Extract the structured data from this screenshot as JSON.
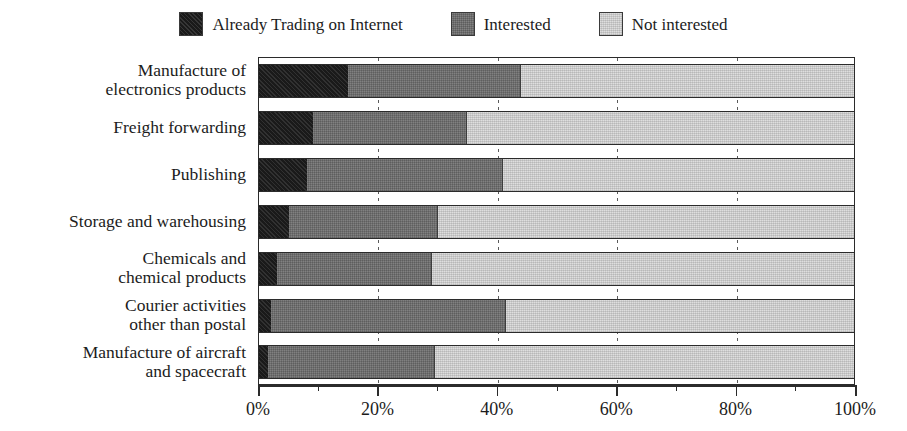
{
  "chart_data": {
    "type": "bar",
    "orientation": "horizontal",
    "stacked": true,
    "stack_total": 100,
    "title": "",
    "subtitle": "",
    "xlabel": "",
    "ylabel": "",
    "xlim": [
      0,
      100
    ],
    "x_tick_labels": [
      "0%",
      "20%",
      "40%",
      "60%",
      "80%",
      "100%"
    ],
    "x_ticks": [
      0,
      20,
      40,
      60,
      80,
      100
    ],
    "x_minor_ticks": [
      10,
      30,
      50,
      70,
      90
    ],
    "grid": "vertical-dotted-gridlines",
    "legend_position": "top-center",
    "categories": [
      "Manufacture of\nelectronics products",
      "Freight forwarding",
      "Publishing",
      "Storage and warehousing",
      "Chemicals and\nchemical products",
      "Courier activities\nother than postal",
      "Manufacture of aircraft\nand spacecraft"
    ],
    "series": [
      {
        "name": "Already Trading on Internet",
        "color": "#1a1a1a",
        "values": [
          15,
          9,
          8,
          5,
          3,
          2,
          1.5
        ]
      },
      {
        "name": "Interested",
        "color": "#6e6e6e",
        "values": [
          29,
          26,
          33,
          25,
          26,
          39.5,
          28
        ]
      },
      {
        "name": "Not interested",
        "color": "#cdcdcd",
        "values": [
          56,
          65,
          59,
          70,
          71,
          58.5,
          70.5
        ]
      }
    ]
  },
  "legend": {
    "items": [
      {
        "label": "Already Trading on Internet",
        "color": "#1a1a1a"
      },
      {
        "label": "Interested",
        "color": "#6e6e6e"
      },
      {
        "label": "Not interested",
        "color": "#cdcdcd"
      }
    ]
  }
}
